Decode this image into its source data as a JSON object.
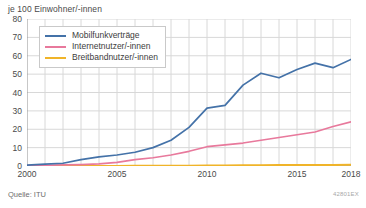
{
  "axis_title": "je 100 Einwohner/-innen",
  "source_note": "Quelle: ITU",
  "figure_code": "42801EX",
  "colors": {
    "mobile": "#4472a8",
    "internet": "#e8799c",
    "broadband": "#f0b429",
    "grid": "#d8d8d8",
    "axis": "#909090",
    "text": "#4a4a4a"
  },
  "legend": {
    "items": [
      {
        "label": "Mobilfunkverträge",
        "color_key": "mobile"
      },
      {
        "label": "Internetnutzer/-innen",
        "color_key": "internet"
      },
      {
        "label": "Breitbandnutzer/-innen",
        "color_key": "broadband"
      }
    ]
  },
  "chart_data": {
    "type": "line",
    "title": "je 100 Einwohner/-innen",
    "xlabel": "",
    "ylabel": "je 100 Einwohner/-innen",
    "xlim": [
      2000,
      2018
    ],
    "ylim": [
      0,
      80
    ],
    "grid": true,
    "legend_position": "top-left",
    "x": [
      2000,
      2001,
      2002,
      2003,
      2004,
      2005,
      2006,
      2007,
      2008,
      2009,
      2010,
      2011,
      2012,
      2013,
      2014,
      2015,
      2016,
      2017,
      2018
    ],
    "xticks": [
      2000,
      2005,
      2010,
      2015,
      2018
    ],
    "yticks": [
      0,
      10,
      20,
      30,
      40,
      50,
      60,
      70,
      80
    ],
    "series": [
      {
        "name": "Mobilfunkverträge",
        "color": "#4472a8",
        "values": [
          0.5,
          1.0,
          1.5,
          3.5,
          5.0,
          6.0,
          7.5,
          10.0,
          14.0,
          21.0,
          31.5,
          33.0,
          44.0,
          50.5,
          48.0,
          52.5,
          56.0,
          53.5,
          58.0
        ],
        "values_note": "peak 61 at 2017"
      },
      {
        "name": "Internetnutzer/-innen",
        "color": "#e8799c",
        "values": [
          0.2,
          0.4,
          0.6,
          0.8,
          1.2,
          2.0,
          3.5,
          4.5,
          6.0,
          8.0,
          10.5,
          11.5,
          12.5,
          14.0,
          15.5,
          17.0,
          18.5,
          21.5,
          24.0
        ]
      },
      {
        "name": "Breitbandnutzer/-innen",
        "color": "#f0b429",
        "values": [
          0.0,
          0.0,
          0.0,
          0.0,
          0.0,
          0.0,
          0.1,
          0.1,
          0.2,
          0.2,
          0.3,
          0.3,
          0.4,
          0.4,
          0.5,
          0.5,
          0.6,
          0.6,
          0.7
        ]
      }
    ]
  }
}
